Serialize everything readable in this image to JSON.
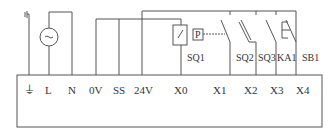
{
  "diagram": {
    "type": "PLC input wiring diagram",
    "terminals": [
      {
        "id": "ground",
        "label": "⏚",
        "x": 29
      },
      {
        "id": "L",
        "label": "L",
        "x": 49
      },
      {
        "id": "N",
        "label": "N",
        "x": 72
      },
      {
        "id": "0V",
        "label": "0V",
        "x": 96
      },
      {
        "id": "SS",
        "label": "SS",
        "x": 119
      },
      {
        "id": "24V",
        "label": "24V",
        "x": 142
      },
      {
        "id": "X0",
        "label": "X0",
        "x": 181
      },
      {
        "id": "X1",
        "label": "X1",
        "x": 230
      },
      {
        "id": "X2",
        "label": "X2",
        "x": 256
      },
      {
        "id": "X3",
        "label": "X3",
        "x": 276
      },
      {
        "id": "X4",
        "label": "X4",
        "x": 296
      }
    ],
    "devices": [
      {
        "id": "ac-source",
        "label": "~",
        "type": "AC power source"
      },
      {
        "id": "SQ1",
        "label": "SQ1",
        "type": "limit switch (boxed)",
        "terminal": "X0"
      },
      {
        "id": "SQ2",
        "label": "SQ2",
        "type": "pressure switch",
        "terminal": "X1",
        "actuator_label": "P"
      },
      {
        "id": "SQ3",
        "label": "SQ3",
        "type": "normally open switch",
        "terminal": "X2"
      },
      {
        "id": "KA1",
        "label": "KA1",
        "type": "relay contact / pushbutton",
        "terminal": "X3"
      },
      {
        "id": "SB1",
        "label": "SB1",
        "type": "normally open switch",
        "terminal": "X4"
      }
    ],
    "colors": {
      "line": "#555555",
      "text": "#333333",
      "background": "#ffffff"
    }
  }
}
